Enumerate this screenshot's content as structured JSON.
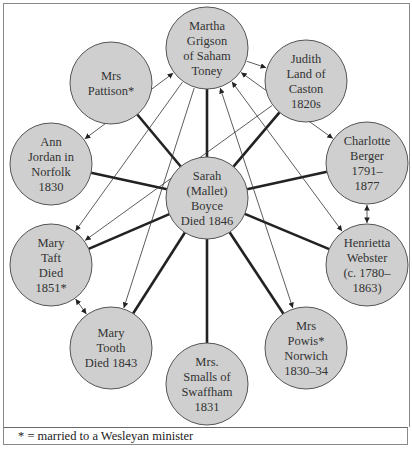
{
  "diagram": {
    "center": {
      "id": "sarah",
      "lines": [
        "Sarah",
        "(Mallet)",
        "Boyce",
        "Died 1846"
      ],
      "x": 206,
      "y": 197
    },
    "nodes": [
      {
        "id": "martha",
        "lines": [
          "Martha",
          "Grigson",
          "of Saham",
          "Toney"
        ],
        "x": 206,
        "y": 47
      },
      {
        "id": "pattison",
        "lines": [
          "Mrs",
          "Pattison*"
        ],
        "x": 110,
        "y": 82
      },
      {
        "id": "judith",
        "lines": [
          "Judith",
          "Land of",
          "Caston",
          "1820s"
        ],
        "x": 305,
        "y": 80
      },
      {
        "id": "ann",
        "lines": [
          "Ann",
          "Jordan in",
          "Norfolk",
          "1830"
        ],
        "x": 50,
        "y": 163
      },
      {
        "id": "charlotte",
        "lines": [
          "Charlotte",
          "Berger",
          "1791–",
          "1877"
        ],
        "x": 366,
        "y": 162
      },
      {
        "id": "taft",
        "lines": [
          "Mary",
          "Taft",
          "Died",
          "1851*"
        ],
        "x": 50,
        "y": 264
      },
      {
        "id": "henrietta",
        "lines": [
          "Henrietta",
          "Webster",
          "(c. 1780–",
          "1863)"
        ],
        "x": 366,
        "y": 264
      },
      {
        "id": "tooth",
        "lines": [
          "Mary",
          "Tooth",
          "Died 1843"
        ],
        "x": 110,
        "y": 347
      },
      {
        "id": "smalls",
        "lines": [
          "Mrs.",
          "Smalls of",
          "Swaffham",
          "1831"
        ],
        "x": 206,
        "y": 383
      },
      {
        "id": "powis",
        "lines": [
          "Mrs",
          "Powis*",
          "Norwich",
          "1830–34"
        ],
        "x": 305,
        "y": 347
      }
    ],
    "radius": 41,
    "arrows": [
      {
        "from": "martha",
        "to": "ann",
        "type": "both"
      },
      {
        "from": "martha",
        "to": "taft",
        "type": "to"
      },
      {
        "from": "martha",
        "to": "tooth",
        "type": "to"
      },
      {
        "from": "martha",
        "to": "judith",
        "type": "to"
      },
      {
        "from": "martha",
        "to": "charlotte",
        "type": "both"
      },
      {
        "from": "martha",
        "to": "henrietta",
        "type": "both"
      },
      {
        "from": "martha",
        "to": "powis",
        "type": "both"
      },
      {
        "from": "judith",
        "to": "taft",
        "type": "to"
      },
      {
        "from": "charlotte",
        "to": "henrietta",
        "type": "both"
      },
      {
        "from": "taft",
        "to": "tooth",
        "type": "both"
      }
    ]
  },
  "footer": {
    "note": "* = married to a Wesleyan minister"
  },
  "credit": "Diagram — Boyce's circle of women"
}
